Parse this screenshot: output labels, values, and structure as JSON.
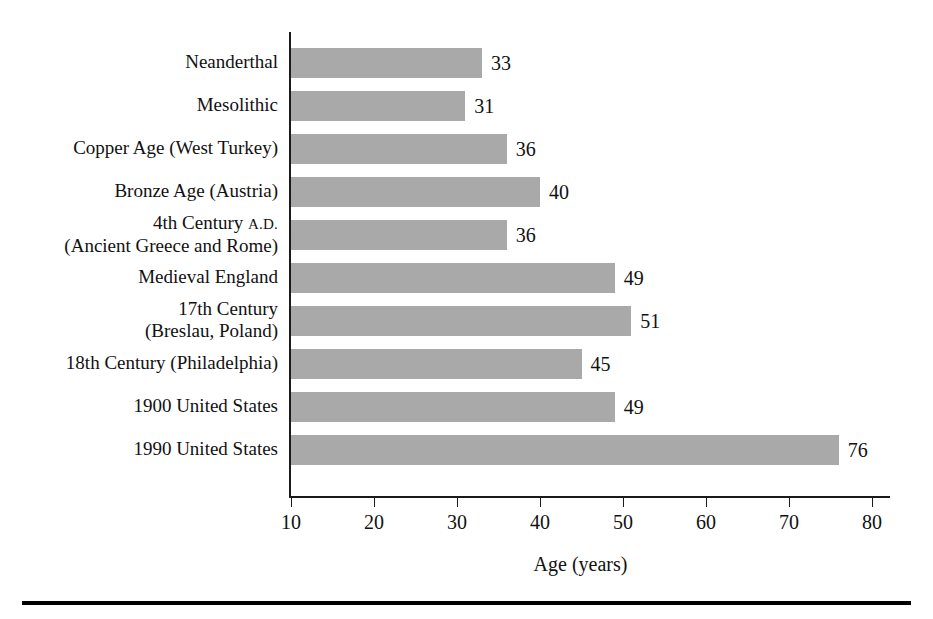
{
  "chart_data": {
    "type": "bar",
    "orientation": "horizontal",
    "title": "",
    "xlabel": "Age (years)",
    "ylabel": "",
    "xlim": [
      10,
      80
    ],
    "xticks": [
      10,
      20,
      30,
      40,
      50,
      60,
      70,
      80
    ],
    "xtick_labels": [
      "10",
      "20",
      "30",
      "40",
      "50",
      "60",
      "70",
      "80"
    ],
    "grid": false,
    "legend": null,
    "bar_color": "#a9a9a9",
    "axis_color": "#1a1a1a",
    "categories": [
      "Neanderthal",
      "Mesolithic",
      "Copper Age (West Turkey)",
      "Bronze Age (Austria)",
      "4th Century A.D. (Ancient Greece and Rome)",
      "Medieval England",
      "17th Century (Breslau, Poland)",
      "18th Century (Philadelphia)",
      "1900 United States",
      "1990 United States"
    ],
    "values": [
      33,
      31,
      36,
      40,
      36,
      49,
      51,
      45,
      49,
      76
    ],
    "data_labels": [
      "33",
      "31",
      "36",
      "40",
      "36",
      "49",
      "51",
      "45",
      "49",
      "76"
    ]
  },
  "rows": [
    {
      "label_line1": "Neanderthal",
      "label_line2": "",
      "smallcaps": "",
      "value": 33,
      "value_label": "33"
    },
    {
      "label_line1": "Mesolithic",
      "label_line2": "",
      "smallcaps": "",
      "value": 31,
      "value_label": "31"
    },
    {
      "label_line1": "Copper Age (West Turkey)",
      "label_line2": "",
      "smallcaps": "",
      "value": 36,
      "value_label": "36"
    },
    {
      "label_line1": "Bronze Age (Austria)",
      "label_line2": "",
      "smallcaps": "",
      "value": 40,
      "value_label": "40"
    },
    {
      "label_line1": "4th Century ",
      "label_line2": "(Ancient Greece and Rome)",
      "smallcaps": "A.D.",
      "value": 36,
      "value_label": "36"
    },
    {
      "label_line1": "Medieval England",
      "label_line2": "",
      "smallcaps": "",
      "value": 49,
      "value_label": "49"
    },
    {
      "label_line1": "17th Century",
      "label_line2": "(Breslau, Poland)",
      "smallcaps": "",
      "value": 51,
      "value_label": "51"
    },
    {
      "label_line1": "18th Century (Philadelphia)",
      "label_line2": "",
      "smallcaps": "",
      "value": 45,
      "value_label": "45"
    },
    {
      "label_line1": "1900 United States",
      "label_line2": "",
      "smallcaps": "",
      "value": 49,
      "value_label": "49"
    },
    {
      "label_line1": "1990 United States",
      "label_line2": "",
      "smallcaps": "",
      "value": 76,
      "value_label": "76"
    }
  ],
  "axis": {
    "x_title": "Age (years)",
    "ticks": [
      "10",
      "20",
      "30",
      "40",
      "50",
      "60",
      "70",
      "80"
    ]
  }
}
